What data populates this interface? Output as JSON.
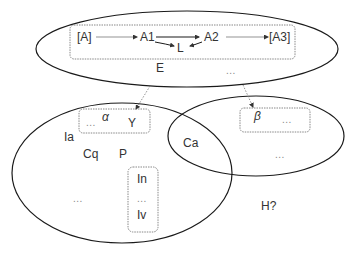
{
  "diagram": {
    "colors": {
      "ellipse_stroke": "#1a1a1a",
      "box_stroke": "#888888",
      "arrow_dotted": "#777777",
      "arrow_solid": "#1a1a1a",
      "text": "#333333",
      "ellipsis": "#888888"
    },
    "top_ellipse": {
      "label": "E",
      "ellipsis": "...",
      "pathway_box": {
        "nodes": [
          "[A]",
          "A1",
          "A2",
          "[A3]"
        ],
        "side_node": "L"
      }
    },
    "left_ellipse": {
      "labels": [
        "Ia",
        "Cq",
        "P"
      ],
      "ellipsis": "...",
      "alpha_box": {
        "greek": "α",
        "ellipsis": "...",
        "label": "Y"
      },
      "in_box": {
        "top": "In",
        "middle": "...",
        "bottom": "Iv"
      }
    },
    "right_ellipse": {
      "ellipsis": "...",
      "beta_box": {
        "greek": "β",
        "ellipsis": "..."
      }
    },
    "overlap_label": "Ca",
    "outside_label": "H?"
  }
}
